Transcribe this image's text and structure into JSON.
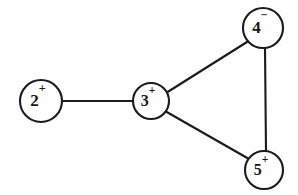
{
  "diagram": {
    "background_color": "#fefefe",
    "stroke_color": "#1b1b1f",
    "node_fill_color": "#ffffff",
    "nodes": [
      {
        "id": "2",
        "label": "2",
        "charge": "+",
        "cx": 41,
        "cy": 101,
        "r": 21,
        "font_size": 17
      },
      {
        "id": "3",
        "label": "3",
        "charge": "+",
        "cx": 151,
        "cy": 101,
        "r": 18,
        "font_size": 16
      },
      {
        "id": "4",
        "label": "4",
        "charge": "−",
        "cx": 263,
        "cy": 28,
        "r": 20,
        "font_size": 17
      },
      {
        "id": "5",
        "label": "5",
        "charge": "+",
        "cx": 264,
        "cy": 170,
        "r": 19,
        "font_size": 16
      }
    ],
    "edges": [
      {
        "id": "edge-2-3",
        "from": "2",
        "to": "3",
        "x1": 62,
        "y1": 101,
        "x2": 133,
        "y2": 101
      },
      {
        "id": "edge-3-4",
        "from": "3",
        "to": "4",
        "x1": 166,
        "y1": 93,
        "x2": 247,
        "y2": 42
      },
      {
        "id": "edge-3-5",
        "from": "3",
        "to": "5",
        "x1": 165,
        "y1": 111,
        "x2": 249,
        "y2": 159
      },
      {
        "id": "edge-4-5",
        "from": "4",
        "to": "5",
        "x1": 265,
        "y1": 48,
        "x2": 266,
        "y2": 151
      }
    ]
  }
}
